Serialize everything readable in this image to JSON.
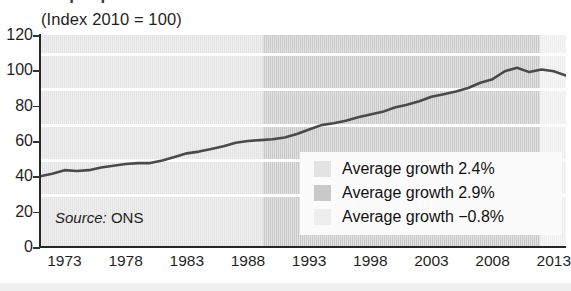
{
  "figure": {
    "title_fragment": "Output per hour",
    "subtitle": "(Index 2010 = 100)",
    "source_label": "Source:",
    "source_value": "ONS"
  },
  "legend": {
    "items": [
      {
        "label": "Average growth 2.4%",
        "color": "#e3e3e3",
        "name": "legend-band-1"
      },
      {
        "label": "Average growth 2.9%",
        "color": "#c9c9c9",
        "name": "legend-band-2"
      },
      {
        "label": "Average growth −0.8%",
        "color": "#eeeeee",
        "name": "legend-band-3"
      }
    ]
  },
  "chart_data": {
    "type": "line",
    "title": "Output per hour",
    "subtitle": "(Index 2010 = 100)",
    "xlabel": "",
    "ylabel": "",
    "xlim": [
      1971,
      2014
    ],
    "ylim": [
      0,
      120
    ],
    "grid": true,
    "legend_position": "inside-bottom-right",
    "yticks": [
      0,
      20,
      40,
      60,
      80,
      100,
      120
    ],
    "xticks": [
      1973,
      1978,
      1983,
      1988,
      1993,
      1998,
      2003,
      2008,
      2013
    ],
    "source": "ONS",
    "bands": [
      {
        "label": "Average growth 2.4%",
        "x_start": 1971,
        "x_end": 1990,
        "color": "#e3e3e3"
      },
      {
        "label": "Average growth 2.9%",
        "x_start": 1990,
        "x_end": 2008,
        "color": "#c9c9c9"
      },
      {
        "label": "Average growth −0.8%",
        "x_start": 2008,
        "x_end": 2014,
        "color": "#eeeeee"
      }
    ],
    "series": [
      {
        "name": "Output per hour",
        "color": "#4a4a4a",
        "x": [
          1971,
          1972,
          1973,
          1974,
          1975,
          1976,
          1977,
          1978,
          1979,
          1980,
          1981,
          1982,
          1983,
          1984,
          1985,
          1986,
          1987,
          1988,
          1989,
          1990,
          1991,
          1992,
          1993,
          1994,
          1995,
          1996,
          1997,
          1998,
          1999,
          2000,
          2001,
          2002,
          2003,
          2004,
          2005,
          2006,
          2007,
          2008,
          2009,
          2010,
          2011,
          2012,
          2013,
          2014
        ],
        "values": [
          40.0,
          41.5,
          43.5,
          43.0,
          43.5,
          45.0,
          46.0,
          47.0,
          47.5,
          47.5,
          49.0,
          51.0,
          53.0,
          54.0,
          55.5,
          57.0,
          59.0,
          60.0,
          60.5,
          61.0,
          62.0,
          64.0,
          66.5,
          69.0,
          70.0,
          71.5,
          73.5,
          75.0,
          76.5,
          79.0,
          80.5,
          82.5,
          85.0,
          86.5,
          88.0,
          90.0,
          93.0,
          95.0,
          99.5,
          101.5,
          99.0,
          100.5,
          99.5,
          97.0
        ]
      }
    ]
  }
}
